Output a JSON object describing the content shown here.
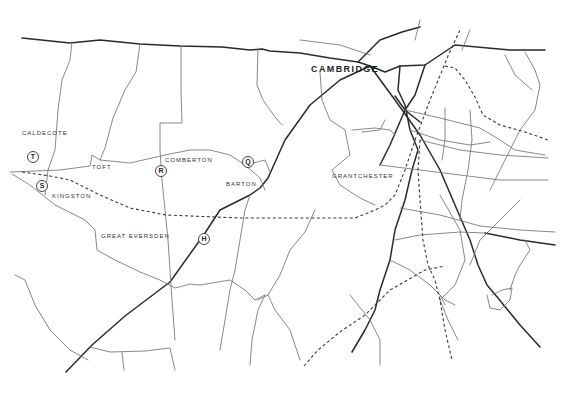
{
  "map": {
    "city_label": "CAMBRIDGE",
    "villages": [
      {
        "name": "CALDECOTE",
        "x": 22,
        "y": 131
      },
      {
        "name": "TOFT",
        "x": 92,
        "y": 166
      },
      {
        "name": "COMBERTON",
        "x": 165,
        "y": 158
      },
      {
        "name": "BARTON",
        "x": 226,
        "y": 182
      },
      {
        "name": "KINGSTON",
        "x": 52,
        "y": 195
      },
      {
        "name": "GRANTCHESTER",
        "x": 332,
        "y": 174
      },
      {
        "name": "GREAT EVERSDEN",
        "x": 101,
        "y": 235
      }
    ],
    "markers": [
      {
        "letter": "T",
        "x": 27,
        "y": 151
      },
      {
        "letter": "S",
        "x": 36,
        "y": 180
      },
      {
        "letter": "R",
        "x": 155,
        "y": 165
      },
      {
        "letter": "Q",
        "x": 242,
        "y": 156
      },
      {
        "letter": "H",
        "x": 198,
        "y": 233
      }
    ],
    "colors": {
      "major_road": "#2a2a2a",
      "minor_road": "#7a7a7a",
      "railway": "#3a3a3a",
      "background": "#ffffff"
    }
  }
}
